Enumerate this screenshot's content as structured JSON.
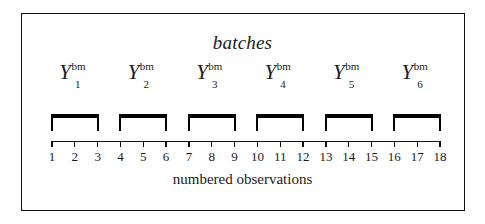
{
  "figure": {
    "title": "batches",
    "caption": "numbered observations",
    "background_color": "#ffffff",
    "ink_color": "#111111",
    "width": 485,
    "height": 224
  },
  "chart_data": {
    "type": "diagram",
    "title": "batches",
    "xlabel": "numbered observations",
    "ylabel": "",
    "grid": false,
    "legend": "none",
    "axis": {
      "tick_values": [
        1,
        2,
        3,
        4,
        5,
        6,
        7,
        8,
        9,
        10,
        11,
        12,
        13,
        14,
        15,
        16,
        17,
        18
      ],
      "tick_labels": [
        "1",
        "2",
        "3",
        "4",
        "5",
        "6",
        "7",
        "8",
        "9",
        "10",
        "11",
        "12",
        "13",
        "14",
        "15",
        "16",
        "17",
        "18"
      ],
      "xlim": [
        1,
        18
      ],
      "tick_direction": "down"
    },
    "groups": [
      {
        "label_base": "Y",
        "superscript": "bm",
        "subscript": "1",
        "span_start": 1,
        "span_end": 3,
        "members": [
          1,
          2,
          3
        ]
      },
      {
        "label_base": "Y",
        "superscript": "bm",
        "subscript": "2",
        "span_start": 4,
        "span_end": 6,
        "members": [
          4,
          5,
          6
        ]
      },
      {
        "label_base": "Y",
        "superscript": "bm",
        "subscript": "3",
        "span_start": 7,
        "span_end": 9,
        "members": [
          7,
          8,
          9
        ]
      },
      {
        "label_base": "Y",
        "superscript": "bm",
        "subscript": "4",
        "span_start": 10,
        "span_end": 12,
        "members": [
          10,
          11,
          12
        ]
      },
      {
        "label_base": "Y",
        "superscript": "bm",
        "subscript": "5",
        "span_start": 13,
        "span_end": 15,
        "members": [
          13,
          14,
          15
        ]
      },
      {
        "label_base": "Y",
        "superscript": "bm",
        "subscript": "6",
        "span_start": 16,
        "span_end": 18,
        "members": [
          16,
          17,
          18
        ]
      }
    ],
    "batch_count": 6,
    "batch_size": 3,
    "observation_count": 18
  }
}
